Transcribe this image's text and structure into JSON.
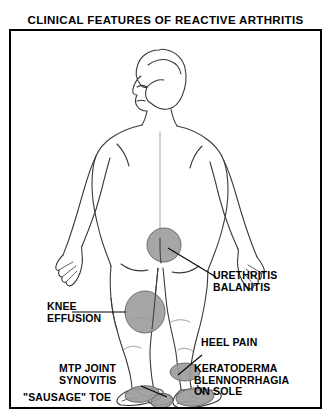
{
  "figure": {
    "title": "CLINICAL FEATURES OF REACTIVE ARTHRITIS",
    "line_color": "#3a3a3a",
    "lesion_color": "#9a9a9a",
    "frame_color": "#000000",
    "background": "#ffffff"
  },
  "annotations": [
    {
      "id": "urethritis",
      "lines": [
        "URETHRITIS",
        "BALANITIS"
      ],
      "site": "groin"
    },
    {
      "id": "knee-effusion",
      "lines": [
        "KNEE",
        "EFFUSION"
      ],
      "site": "knee"
    },
    {
      "id": "heel-pain",
      "lines": [
        "HEEL PAIN"
      ],
      "site": "heel"
    },
    {
      "id": "keratoderma",
      "lines": [
        "KERATODERMA",
        "BLENNORRHAGIA",
        "ON SOLE"
      ],
      "site": "sole"
    },
    {
      "id": "mtp-joint-synovitis",
      "lines": [
        "MTP JOINT",
        "SYNOVITIS"
      ],
      "site": "metatarsophalangeal-joint"
    },
    {
      "id": "sausage-toe",
      "lines": [
        "\"SAUSAGE\" TOE"
      ],
      "site": "toe"
    }
  ],
  "lesions": [
    {
      "id": "lesion-groin",
      "cx": 153,
      "cy": 213,
      "rx": 17,
      "ry": 17
    },
    {
      "id": "lesion-knee",
      "cx": 134,
      "cy": 280,
      "rx": 20,
      "ry": 21
    },
    {
      "id": "lesion-heel",
      "cx": 174,
      "cy": 340,
      "rx": 15,
      "ry": 9
    },
    {
      "id": "lesion-left-sole",
      "cx": 131,
      "cy": 362,
      "rx": 17,
      "ry": 8
    },
    {
      "id": "lesion-right-sole",
      "cx": 184,
      "cy": 365,
      "rx": 19,
      "ry": 9
    },
    {
      "id": "lesion-toe",
      "cx": 151,
      "cy": 369,
      "rx": 11,
      "ry": 7
    }
  ]
}
